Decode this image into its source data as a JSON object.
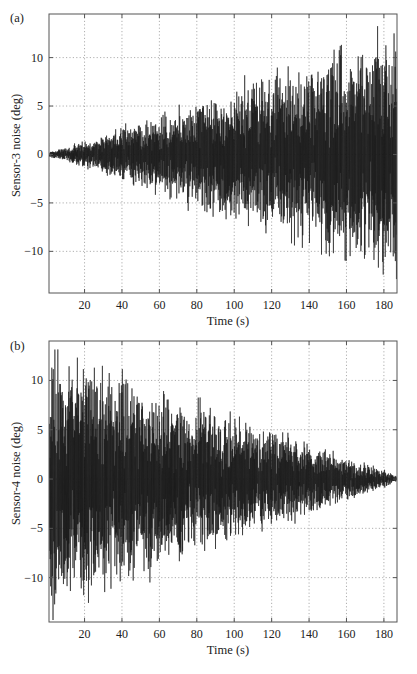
{
  "chart_data": [
    {
      "id": "a",
      "type": "line",
      "panel_label": "(a)",
      "title": "",
      "xlabel": "Time (s)",
      "ylabel": "Sensor-3 noise (deg)",
      "xlim": [
        1,
        187
      ],
      "ylim": [
        -14.3,
        14.5
      ],
      "xticks": [
        20,
        40,
        60,
        80,
        100,
        120,
        140,
        160,
        180
      ],
      "yticks": [
        -10,
        -5,
        0,
        5,
        10
      ],
      "grid": true,
      "legend": null,
      "series": [
        {
          "name": "Sensor-3 noise",
          "description": "Dense oscillating noise whose envelope grows roughly linearly with time",
          "envelope": {
            "t": [
              1,
              20,
              40,
              60,
              80,
              100,
              120,
              140,
              160,
              180,
              187
            ],
            "amplitude": [
              0.3,
              1.5,
              3.0,
              4.5,
              6.0,
              7.5,
              9.0,
              10.5,
              12.0,
              13.5,
              14.0
            ]
          },
          "color": "#1a1a1a"
        }
      ]
    },
    {
      "id": "b",
      "type": "line",
      "panel_label": "(b)",
      "title": "",
      "xlabel": "Time (s)",
      "ylabel": "Sensor-4 noise (deg)",
      "xlim": [
        1,
        187
      ],
      "ylim": [
        -14.5,
        14.0
      ],
      "xticks": [
        20,
        40,
        60,
        80,
        100,
        120,
        140,
        160,
        180
      ],
      "yticks": [
        -10,
        -5,
        0,
        5,
        10
      ],
      "grid": true,
      "legend": null,
      "series": [
        {
          "name": "Sensor-4 noise",
          "description": "Dense oscillating noise whose envelope decays roughly linearly with time",
          "envelope": {
            "t": [
              1,
              20,
              40,
              60,
              80,
              100,
              120,
              140,
              160,
              180,
              187
            ],
            "amplitude": [
              14.0,
              13.0,
              11.5,
              10.0,
              8.5,
              7.0,
              5.5,
              4.0,
              2.5,
              1.0,
              0.3
            ]
          },
          "color": "#1a1a1a"
        }
      ]
    }
  ],
  "layout": {
    "panels": [
      {
        "left": 49,
        "top": 14,
        "right": 397,
        "bottom": 293
      },
      {
        "left": 49,
        "top": 341,
        "right": 397,
        "bottom": 622
      }
    ]
  }
}
